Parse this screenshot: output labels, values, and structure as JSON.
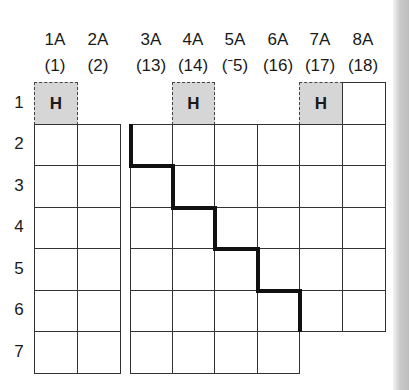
{
  "groups": [
    {
      "name": "1A",
      "number": "(1)"
    },
    {
      "name": "2A",
      "number": "(2)"
    },
    {
      "name": "3A",
      "number": "(13)"
    },
    {
      "name": "4A",
      "number": "(14)"
    },
    {
      "name": "5A",
      "number": "(ˉ5)"
    },
    {
      "name": "6A",
      "number": "(16)"
    },
    {
      "name": "7A",
      "number": "(17)"
    },
    {
      "name": "8A",
      "number": "(18)"
    }
  ],
  "periods": [
    "1",
    "2",
    "3",
    "4",
    "5",
    "6",
    "7"
  ],
  "hydrogen_cells": [
    {
      "symbol": "H",
      "group": "1A"
    },
    {
      "symbol": "H",
      "group": "4A"
    },
    {
      "symbol": "H",
      "group": "7A"
    }
  ],
  "notes": {
    "stair_line": "metal/nonmetal dividing staircase from 3A period 2 to 6A period 6",
    "period7_right_block": "columns 3A to 6A only"
  }
}
